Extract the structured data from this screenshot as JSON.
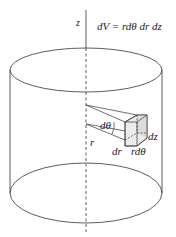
{
  "diagram": {
    "labels": {
      "axis": "z",
      "equation": "dV = rdθ dr dz",
      "dtheta": "dθ",
      "r": "r",
      "dr": "dr",
      "rdtheta": "rdθ",
      "dz": "dz"
    },
    "colors": {
      "stroke": "#333333",
      "box_fill": "#e9e9e9",
      "background": "#ffffff"
    }
  }
}
